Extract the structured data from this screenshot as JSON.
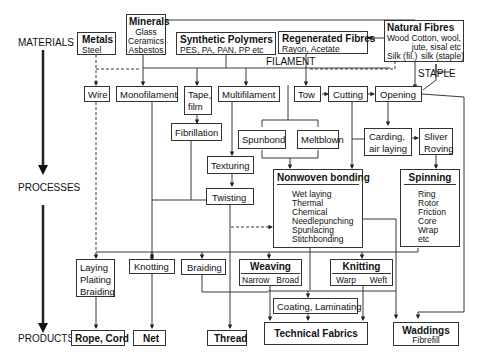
{
  "stages": {
    "materials": "MATERIALS",
    "processes": "PROCESSES",
    "products": "PRODUCTS"
  },
  "materials": {
    "metals": {
      "title": "Metals",
      "items": [
        "Steel"
      ]
    },
    "minerals": {
      "title": "Minerals",
      "items": [
        "Glass",
        "Ceramics",
        "Asbestos"
      ]
    },
    "synthetic": {
      "title": "Synthetic Polymers",
      "items": [
        "PES, PA, PAN, PP etc"
      ]
    },
    "regenerated": {
      "title": "Regenerated Fibres",
      "items": [
        "Rayon, Acetate"
      ]
    },
    "natural": {
      "title": "Natural Fibres",
      "items": [
        "Wood",
        "Cotton, wool,",
        "jute, sisal etc",
        "Silk (fil.)",
        "silk (staple)"
      ]
    }
  },
  "labels": {
    "filament": "FILAMENT",
    "staple": "STAPLE"
  },
  "processes": {
    "wire": "Wire",
    "monofilament": "Monofilament",
    "tape": [
      "Tape,",
      "film"
    ],
    "multifilament": "Multifilament",
    "tow": "Tow",
    "cutting": "Cutting",
    "opening": "Opening",
    "fibrillation": "Fibrillation",
    "spunbond": "Spunbond",
    "meltblown": "Meltblown",
    "carding": [
      "Carding,",
      "air laying"
    ],
    "sliver": [
      "Sliver",
      "Roving"
    ],
    "texturing": "Texturing",
    "twisting": "Twisting",
    "nonwoven": {
      "title": "Nonwoven bonding",
      "items": [
        "Wet laying",
        "Thermal",
        "Chemical",
        "Needlepunching",
        "Spunlacing",
        "Stitchbonding"
      ]
    },
    "spinning": {
      "title": "Spinning",
      "items": [
        "Ring",
        "Rotor",
        "Friction",
        "Core",
        "Wrap",
        "etc"
      ]
    },
    "laying": [
      "Laying",
      "Plaiting",
      "Braiding"
    ],
    "knotting": "Knotting",
    "braiding": "Braiding",
    "weaving": {
      "title": "Weaving",
      "items": [
        "Narrow",
        "Broad"
      ]
    },
    "knitting": {
      "title": "Knitting",
      "items": [
        "Warp",
        "Weft"
      ]
    },
    "coating": "Coating, Laminating"
  },
  "products": {
    "rope": "Rope, Cord",
    "net": "Net",
    "thread": "Thread",
    "technical": "Technical Fabrics",
    "waddings": {
      "title": "Waddings",
      "sub": "Fibrefill"
    }
  }
}
